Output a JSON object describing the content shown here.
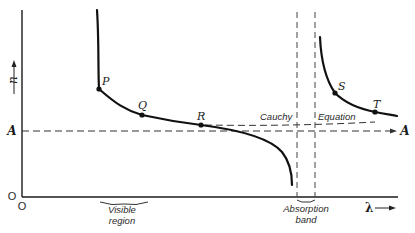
{
  "axes": {
    "y_label": "n",
    "x_label": "λ",
    "origin_label": "O",
    "origin_y_label": "O"
  },
  "asymptote": {
    "left_label": "A",
    "right_label": "A"
  },
  "cauchy": {
    "word1": "Cauchy",
    "word2": "Equation"
  },
  "points": [
    {
      "label": "P"
    },
    {
      "label": "Q"
    },
    {
      "label": "R"
    },
    {
      "label": "S"
    },
    {
      "label": "T"
    }
  ],
  "regions": {
    "visible_line1": "Visible",
    "visible_line2": "region",
    "absorption_line1": "Absorption",
    "absorption_line2": "band"
  },
  "colors": {
    "ink": "#111111",
    "background": "#ffffff"
  }
}
